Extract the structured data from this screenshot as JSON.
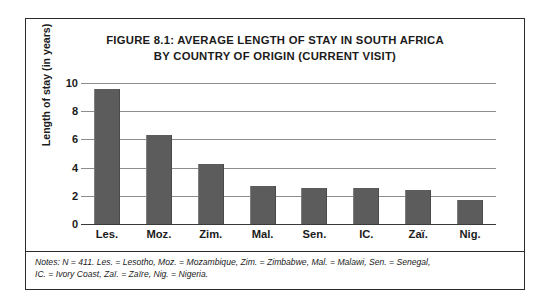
{
  "figure": {
    "title_line1": "FIGURE 8.1: AVERAGE LENGTH OF STAY IN SOUTH AFRICA",
    "title_line2": "BY COUNTRY OF ORIGIN (CURRENT VISIT)",
    "notes_line1": "Notes: N = 411. Les. = Lesotho, Moz. = Mozambique, Zim. = Zimbabwe, Mal. = Malawi, Sen. = Senegal,",
    "notes_line2": "IC. = Ivory Coast, Zaï. = Zaïre, Nig. = Nigeria.",
    "frame_color": "#2b2b2b"
  },
  "chart_data": {
    "type": "bar",
    "title": "FIGURE 8.1: AVERAGE LENGTH OF STAY IN SOUTH AFRICA BY COUNTRY OF ORIGIN (CURRENT VISIT)",
    "xlabel": "",
    "ylabel": "Length of stay (in years)",
    "categories": [
      "Les.",
      "Moz.",
      "Zim.",
      "Mal.",
      "Sen.",
      "IC.",
      "Zaï.",
      "Nig."
    ],
    "values": [
      9.6,
      6.3,
      4.25,
      2.7,
      2.55,
      2.55,
      2.4,
      1.7
    ],
    "ylim": [
      0,
      10
    ],
    "yticks": [
      0,
      2,
      4,
      6,
      8,
      10
    ],
    "ytick_labels": [
      "0",
      "2",
      "4",
      "6",
      "8",
      "10"
    ],
    "grid": true,
    "grid_axis": "y",
    "legend": false,
    "bar_color": "#5c5c5c",
    "grid_color": "#8d8d8d",
    "axis_color": "#3a3a3a"
  }
}
